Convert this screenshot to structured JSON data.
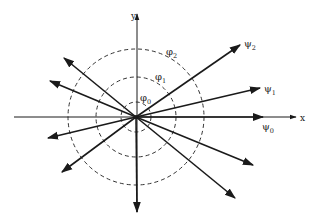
{
  "diagram": {
    "origin": [
      136,
      117
    ],
    "axes": {
      "x": {
        "label": "x",
        "from": [
          14,
          117
        ],
        "to": [
          296,
          117
        ],
        "label_pos": [
          300,
          121
        ]
      },
      "y": {
        "label": "y",
        "from": [
          137,
          212
        ],
        "to": [
          137,
          14
        ],
        "label_pos": [
          131,
          19
        ]
      }
    },
    "circles": [
      {
        "id": "phi0",
        "label": "φ",
        "sub": "0",
        "r": 15,
        "label_pos": [
          140,
          101
        ]
      },
      {
        "id": "phi1",
        "label": "φ",
        "sub": "1",
        "r": 40,
        "label_pos": [
          155,
          80
        ]
      },
      {
        "id": "phi2",
        "label": "φ",
        "sub": "2",
        "r": 68,
        "label_pos": [
          166,
          55
        ]
      }
    ],
    "vectors": [
      {
        "id": "psi0",
        "label": "ψ",
        "sub": "0",
        "to": [
          263,
          117
        ],
        "label_pos": [
          262,
          130
        ]
      },
      {
        "id": "psi1",
        "label": "ψ",
        "sub": "1",
        "to": [
          260,
          88
        ],
        "label_pos": [
          264,
          92
        ]
      },
      {
        "id": "psi2",
        "label": "ψ",
        "sub": "2",
        "to": [
          240,
          45
        ],
        "label_pos": [
          244,
          47
        ]
      },
      {
        "id": "v-ul-1",
        "label": "",
        "to": [
          64,
          58
        ]
      },
      {
        "id": "v-ul-2",
        "label": "",
        "to": [
          50,
          81
        ]
      },
      {
        "id": "v-ll-1",
        "label": "",
        "to": [
          48,
          138
        ]
      },
      {
        "id": "v-ll-2",
        "label": "",
        "to": [
          62,
          172
        ]
      },
      {
        "id": "v-lr-1",
        "label": "",
        "to": [
          253,
          165
        ]
      },
      {
        "id": "v-lr-2",
        "label": "",
        "to": [
          235,
          198
        ]
      },
      {
        "id": "v-down",
        "label": "",
        "to": [
          137,
          212
        ]
      }
    ],
    "colors": {
      "line": "#1a1a1a",
      "dash": "#333333",
      "background": "#ffffff"
    }
  }
}
